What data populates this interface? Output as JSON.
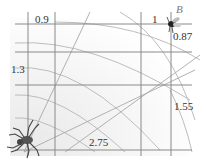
{
  "diagram": {
    "labels": {
      "top_left": "0.9",
      "top_right": "1",
      "point_b": "B",
      "right_top": "0.87",
      "left_middle": "1.3",
      "right_middle": "1.55",
      "bottom": "2.75"
    },
    "icons": {
      "spider": "spider-icon",
      "fly": "fly-icon"
    },
    "colors": {
      "grid_line": "#8a8a8a",
      "web_arc": "#b0b0b0",
      "background": "#ffffff",
      "shading": "#f2f2f2"
    }
  }
}
